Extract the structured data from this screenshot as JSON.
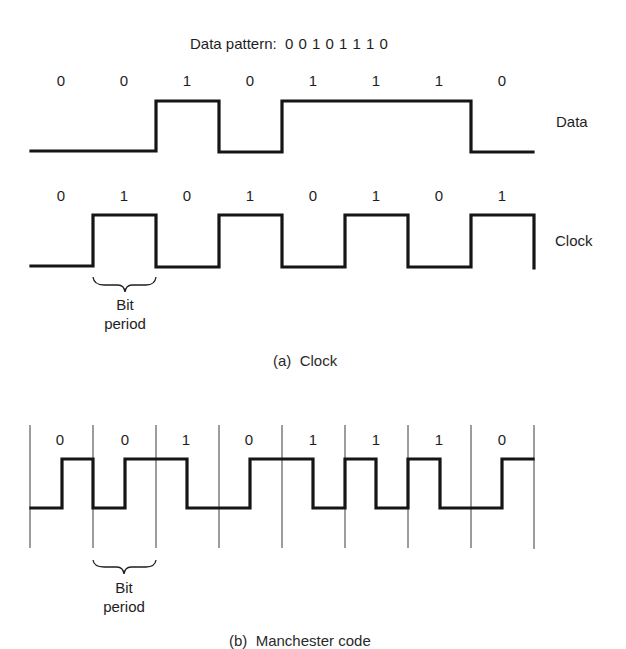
{
  "title": {
    "prefix": "Data pattern:",
    "pattern": "0 0 1 0 1 1 1 0"
  },
  "panel_a": {
    "caption": "(a)  Clock",
    "data_row": {
      "label": "Data",
      "bits": [
        "0",
        "0",
        "1",
        "0",
        "1",
        "1",
        "1",
        "0"
      ]
    },
    "clock_row": {
      "label": "Clock",
      "bits": [
        "0",
        "1",
        "0",
        "1",
        "0",
        "1",
        "0",
        "1"
      ]
    },
    "bit_period": {
      "line1": "Bit",
      "line2": "period"
    }
  },
  "panel_b": {
    "caption": "(b)  Manchester code",
    "bits": [
      "0",
      "0",
      "1",
      "0",
      "1",
      "1",
      "1",
      "0"
    ],
    "bit_period": {
      "line1": "Bit",
      "line2": "period"
    }
  },
  "colors": {
    "ink": "#151515",
    "background": "#ffffff"
  }
}
